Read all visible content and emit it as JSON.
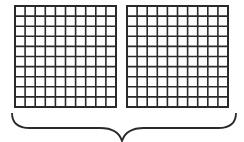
{
  "diagram": {
    "grids": [
      {
        "id": "left",
        "rows": 10,
        "cols": 10,
        "x": 14,
        "y": 5,
        "size": 103
      },
      {
        "id": "right",
        "rows": 10,
        "cols": 10,
        "x": 126,
        "y": 5,
        "size": 103
      }
    ],
    "brace": {
      "x_start": 12,
      "x_end": 236,
      "y_top": 112,
      "tip_x": 122,
      "tip_y": 141
    },
    "colors": {
      "line": "#2a2a2a",
      "background": "#ffffff"
    }
  }
}
